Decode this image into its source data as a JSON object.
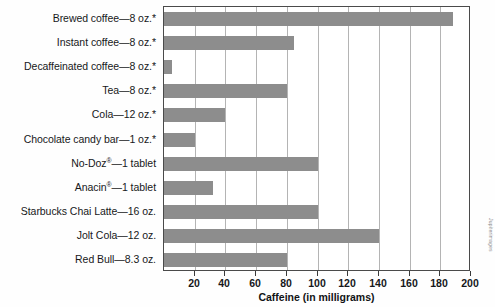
{
  "chart_data": {
    "type": "bar",
    "orientation": "horizontal",
    "title": "",
    "xlabel": "Caffeine (in milligrams)",
    "ylabel": "",
    "xlim": [
      0,
      200
    ],
    "xticks": [
      20,
      40,
      60,
      80,
      100,
      120,
      140,
      160,
      180,
      200
    ],
    "grid": true,
    "legend": false,
    "bar_color": "#8d8d8d",
    "categories": [
      "Brewed coffee—8 oz.*",
      "Instant coffee—8 oz.*",
      "Decaffeinated coffee—8 oz.*",
      "Tea—8 oz.*",
      "Cola—12 oz.*",
      "Chocolate candy bar—1 oz.*",
      "No-Doz®—1 tablet",
      "Anacin®—1 tablet",
      "Starbucks Chai Latte—16 oz.",
      "Jolt Cola—12 oz.",
      "Red Bull—8.3 oz."
    ],
    "values": [
      188,
      85,
      5,
      80,
      40,
      20,
      100,
      32,
      100,
      140,
      80
    ],
    "annotations": [
      "coffee cup photograph"
    ]
  },
  "labels": [
    {
      "text": "Brewed coffee—8 oz.*",
      "sup": ""
    },
    {
      "text": "Instant coffee—8 oz.*",
      "sup": ""
    },
    {
      "text": "Decaffeinated coffee—8 oz.*",
      "sup": ""
    },
    {
      "text": "Tea—8 oz.*",
      "sup": ""
    },
    {
      "text": "Cola—12 oz.*",
      "sup": ""
    },
    {
      "text": "Chocolate candy bar—1 oz.*",
      "sup": ""
    },
    {
      "pre": "No-Doz",
      "sup": "®",
      "post": "—1 tablet"
    },
    {
      "pre": "Anacin",
      "sup": "®",
      "post": "—1 tablet"
    },
    {
      "text": "Starbucks Chai Latte—16 oz.",
      "sup": ""
    },
    {
      "text": "Jolt Cola—12 oz.",
      "sup": ""
    },
    {
      "text": "Red Bull—8.3 oz.",
      "sup": ""
    }
  ],
  "axis": {
    "title": "Caffeine (in milligrams)",
    "tick_labels": [
      "20",
      "40",
      "60",
      "80",
      "100",
      "120",
      "140",
      "160",
      "180",
      "200"
    ]
  },
  "credit": {
    "text": "Jupiterimages"
  },
  "colors": {
    "bar": "#8d8d8d",
    "grid": "#b4b4b4",
    "frame": "#4a4a4a",
    "text": "#16171a",
    "background": "#ffffff"
  }
}
